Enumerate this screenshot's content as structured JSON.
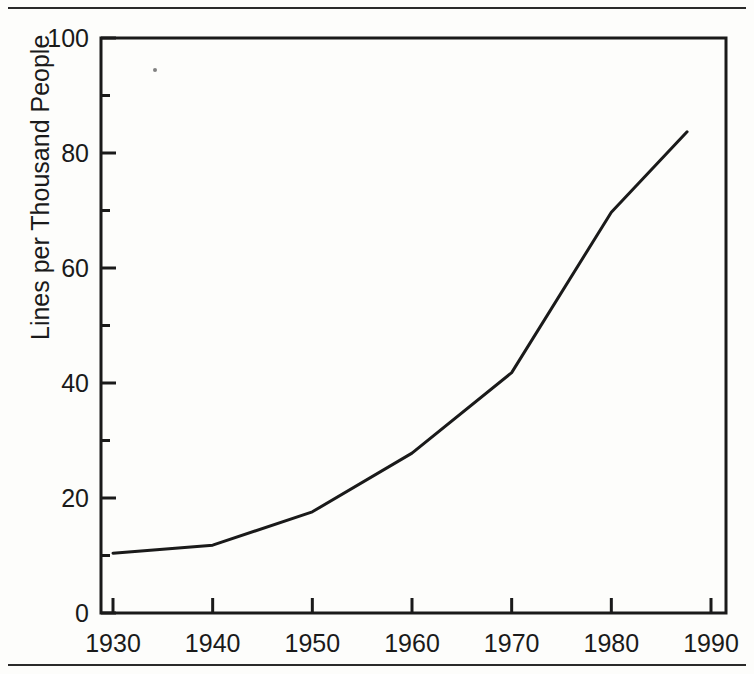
{
  "chart_data": {
    "type": "line",
    "title": "",
    "xlabel": "",
    "ylabel": "Lines per Thousand People",
    "xlim": [
      1930,
      1990
    ],
    "ylim": [
      0,
      100
    ],
    "grid": false,
    "legend": null,
    "x_ticks": [
      1930,
      1940,
      1950,
      1960,
      1970,
      1980,
      1990
    ],
    "x_tick_labels": [
      "1930",
      "1940",
      "1950",
      "1960",
      "1970",
      "1980",
      "1990"
    ],
    "y_ticks": [
      0,
      20,
      40,
      60,
      80,
      100
    ],
    "y_tick_labels": [
      "0",
      "20",
      "40",
      "60",
      "80",
      "100"
    ],
    "y_minor_ticks": [
      10,
      30,
      50,
      70,
      90
    ],
    "series": [
      {
        "name": "Lines per Thousand People",
        "color": "#1a1a1a",
        "line_width": 3,
        "x": [
          1930,
          1940,
          1950,
          1960,
          1970,
          1980,
          1987.6
        ],
        "values": [
          10.4,
          11.8,
          17.6,
          27.8,
          41.8,
          69.7,
          83.7
        ]
      }
    ]
  },
  "axis": {
    "y_title": "Lines per Thousand People"
  }
}
